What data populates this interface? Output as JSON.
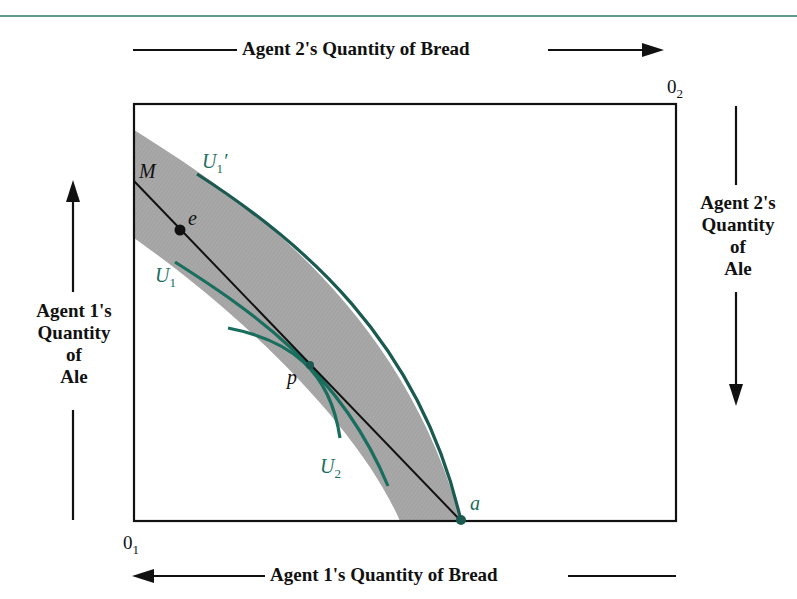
{
  "diagram": {
    "type": "edgeworth-box",
    "axes": {
      "top": "Agent 2's Quantity of Bread",
      "bottom": "Agent 1's Quantity of Bread",
      "left": [
        "Agent 1's",
        "Quantity",
        "of",
        "Ale"
      ],
      "right": [
        "Agent 2's",
        "Quantity",
        "of",
        "Ale"
      ]
    },
    "origins": {
      "agent1": {
        "base": "0",
        "sub": "1"
      },
      "agent2": {
        "base": "0",
        "sub": "2"
      }
    },
    "points": {
      "M": "M",
      "e": "e",
      "p": "p",
      "a": "a"
    },
    "curves": {
      "U1prime": {
        "base": "U",
        "sub": "1",
        "prime": "′"
      },
      "U1": {
        "base": "U",
        "sub": "1"
      },
      "U2": {
        "base": "U",
        "sub": "2"
      }
    },
    "colors": {
      "curve": "#1a6e5e",
      "band": "#a9a9a9",
      "line": "#111111",
      "top_rule": "#5f9a8e"
    }
  }
}
